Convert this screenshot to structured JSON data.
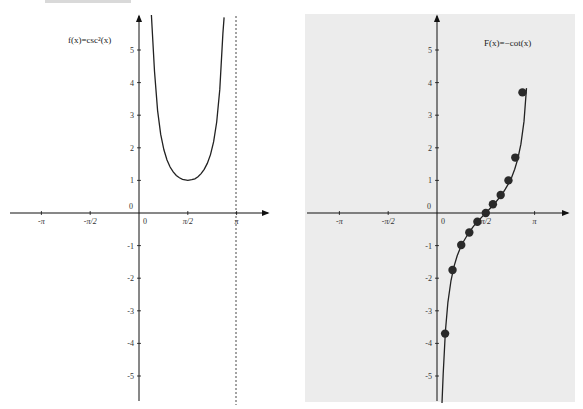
{
  "chart_data": [
    {
      "type": "line",
      "title": "f(x)=csc²(x)",
      "function": "csc^2(x)",
      "label_text": "f(x)=csc²(x)",
      "xlabel": "",
      "ylabel": "",
      "x_ticks": [
        "-π",
        "-π/2",
        "0",
        "π/2",
        "π"
      ],
      "y_ticks": [
        "0",
        "1",
        "2",
        "3",
        "4",
        "5",
        "-1",
        "-2",
        "-3",
        "-4",
        "-5"
      ],
      "xlim": [
        -3.14159,
        4.2
      ],
      "ylim": [
        -5.8,
        6.0
      ],
      "asymptotes": [
        {
          "x": 3.14159,
          "style": "dotted"
        }
      ],
      "x": [
        0.4,
        0.5,
        0.6,
        0.7,
        0.8,
        0.9,
        1.0,
        1.1,
        1.2,
        1.3,
        1.4,
        1.5708,
        1.7,
        1.8,
        1.9,
        2.0,
        2.1,
        2.2,
        2.3,
        2.4,
        2.5,
        2.6,
        2.7,
        2.74
      ],
      "y": [
        6.62,
        4.35,
        3.14,
        2.41,
        1.94,
        1.63,
        1.41,
        1.26,
        1.15,
        1.08,
        1.03,
        1.0,
        1.02,
        1.05,
        1.11,
        1.21,
        1.34,
        1.52,
        1.79,
        2.18,
        2.79,
        3.79,
        5.51,
        6.0
      ],
      "grid": false,
      "background": "#ffffff"
    },
    {
      "type": "line",
      "title": "F(x)=−cot(x)",
      "function": "-cot(x)",
      "label_text": "F(x)=−cot(x)",
      "xlabel": "",
      "ylabel": "",
      "x_ticks": [
        "-π",
        "-π/2",
        "0",
        "π/2",
        "π"
      ],
      "y_ticks": [
        "0",
        "1",
        "2",
        "3",
        "4",
        "5",
        "-1",
        "-2",
        "-3",
        "-4",
        "-5"
      ],
      "xlim": [
        -3.14159,
        4.2
      ],
      "ylim": [
        -5.8,
        6.0
      ],
      "x": [
        0.16,
        0.2,
        0.27,
        0.35,
        0.45,
        0.55,
        0.65,
        0.75,
        0.85,
        0.95,
        1.05,
        1.15,
        1.25,
        1.35,
        1.45,
        1.5708,
        1.7,
        1.8,
        1.9,
        2.0,
        2.1,
        2.2,
        2.3,
        2.4,
        2.5,
        2.6,
        2.7,
        2.8,
        2.88
      ],
      "y": [
        -6.0,
        -4.93,
        -3.63,
        -2.74,
        -2.07,
        -1.63,
        -1.31,
        -1.07,
        -0.88,
        -0.72,
        -0.58,
        -0.44,
        -0.32,
        -0.22,
        -0.12,
        0.0,
        0.13,
        0.23,
        0.34,
        0.46,
        0.58,
        0.73,
        0.9,
        1.09,
        1.34,
        1.66,
        2.11,
        2.81,
        3.83
      ],
      "points": [
        {
          "x": 0.26,
          "y": -3.7
        },
        {
          "x": 0.5,
          "y": -1.75
        },
        {
          "x": 0.78,
          "y": -0.98
        },
        {
          "x": 1.04,
          "y": -0.6
        },
        {
          "x": 1.3,
          "y": -0.27
        },
        {
          "x": 1.5708,
          "y": 0.0
        },
        {
          "x": 1.8,
          "y": 0.27
        },
        {
          "x": 2.05,
          "y": 0.55
        },
        {
          "x": 2.3,
          "y": 1.0
        },
        {
          "x": 2.52,
          "y": 1.7
        },
        {
          "x": 2.75,
          "y": 3.7
        }
      ],
      "grid": false,
      "background": "#ececec"
    }
  ],
  "panels": {
    "left": {
      "label": "f(x)=csc²(x)",
      "x_tick_labels": [
        "-π",
        "-π/2",
        "0",
        "π/2",
        "π"
      ],
      "y_tick_labels_pos": [
        "1",
        "2",
        "3",
        "4",
        "5"
      ],
      "y_tick_labels_neg": [
        "-1",
        "-2",
        "-3",
        "-4",
        "-5"
      ],
      "origin_label": "0"
    },
    "right": {
      "label": "F(x)=−cot(x)",
      "x_tick_labels": [
        "-π",
        "-π/2",
        "0",
        "π/2",
        "π"
      ],
      "y_tick_labels_pos": [
        "1",
        "2",
        "3",
        "4",
        "5"
      ],
      "y_tick_labels_neg": [
        "-1",
        "-2",
        "-3",
        "-4",
        "-5"
      ],
      "origin_label": "0"
    }
  },
  "colors": {
    "axis": "#111111",
    "curve": "#222222",
    "point": "#2a2a2a",
    "right_panel_bg": "#ececec",
    "top_bar": "#d9d9d9"
  }
}
